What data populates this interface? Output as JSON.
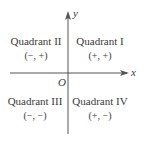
{
  "diagram": {
    "axes": {
      "x_label": "x",
      "y_label": "y",
      "origin_label": "O"
    },
    "quadrants": [
      {
        "name": "Quadrant I",
        "signs": "(+, +)"
      },
      {
        "name": "Quadrant II",
        "signs": "(−, +)"
      },
      {
        "name": "Quadrant III",
        "signs": "(−, −)"
      },
      {
        "name": "Quadrant IV",
        "signs": "(+, −)"
      }
    ]
  }
}
